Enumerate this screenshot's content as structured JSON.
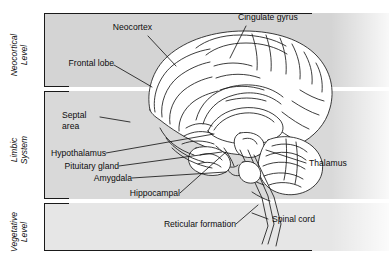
{
  "figure": {
    "background": "#ffffff",
    "band_colors": [
      "#d4d4d4",
      "#d9d9d9",
      "#e6e6e6"
    ],
    "ink_color": "#1a1a1a"
  },
  "levels": [
    {
      "id": "neocortical",
      "label": "Neocortical\nLevel"
    },
    {
      "id": "limbic",
      "label": "Limbic\nSystem"
    },
    {
      "id": "vegetative",
      "label": "Vegetative\nLevel"
    }
  ],
  "labels": {
    "neocortex": "Neocortex",
    "cingulate_gyrus": "Cingulate gyrus",
    "frontal_lobe": "Frontal lobe",
    "septal_area": "Septal\narea",
    "hypothalamus": "Hypothalamus",
    "pituitary_gland": "Pituitary gland",
    "amygdala": "Amygdala",
    "hippocampal": "Hippocampal",
    "thalamus": "Thalamus",
    "spinal_cord": "Spinal cord",
    "reticular_formation": "Reticular formation"
  }
}
